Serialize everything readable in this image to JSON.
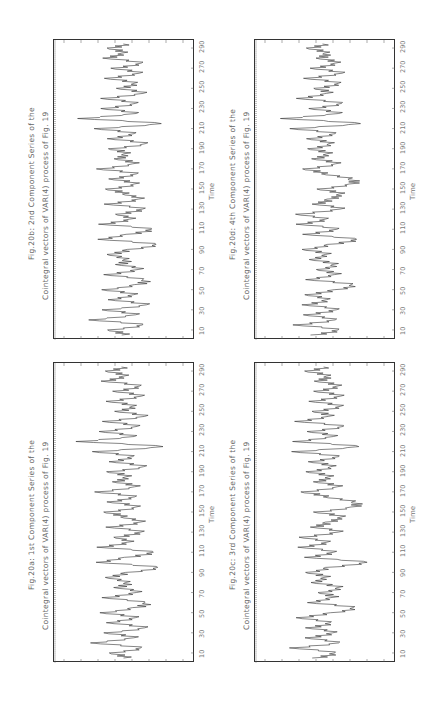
{
  "chart_data": [
    {
      "type": "line",
      "id": "fig20a",
      "title": "Fig.20a: 1st Component Series of the",
      "subtitle": "Cointegral vectors of VAR(4) process of Fig. 19",
      "xlabel": "Time",
      "ylabel": "",
      "xticks": [
        10,
        30,
        50,
        70,
        90,
        110,
        130,
        150,
        170,
        190,
        210,
        230,
        250,
        270,
        290
      ],
      "xlim": [
        1,
        297
      ],
      "ylim": [
        -3,
        3
      ],
      "grid": false,
      "orientation": "rotated-90-ccw",
      "x": [
        5,
        10,
        15,
        20,
        25,
        30,
        35,
        40,
        45,
        50,
        55,
        60,
        65,
        70,
        75,
        80,
        85,
        90,
        95,
        100,
        105,
        110,
        115,
        120,
        125,
        130,
        135,
        140,
        145,
        150,
        155,
        160,
        165,
        170,
        175,
        180,
        185,
        190,
        195,
        200,
        205,
        210,
        215,
        220,
        225,
        230,
        235,
        240,
        245,
        250,
        255,
        260,
        265,
        270,
        275,
        280,
        285,
        290,
        295
      ],
      "values": [
        0.3,
        -0.8,
        1.2,
        -1.5,
        0.9,
        -1.1,
        1.4,
        -0.6,
        1.0,
        -1.3,
        0.7,
        1.6,
        -0.9,
        0.8,
        -0.4,
        0.5,
        -0.7,
        0.2,
        2.1,
        -1.2,
        0.4,
        1.8,
        -1.4,
        0.6,
        -0.2,
        1.1,
        -0.9,
        1.3,
        0.2,
        -1.0,
        0.8,
        -0.6,
        1.0,
        -1.5,
        0.7,
        -0.3,
        0.5,
        -0.8,
        1.2,
        -0.5,
        0.9,
        -1.6,
        2.3,
        -2.4,
        1.0,
        -1.2,
        0.8,
        -0.9,
        1.6,
        -0.3,
        0.5,
        -0.7,
        1.4,
        -0.4,
        0.9,
        -1.0,
        0.4,
        -0.8,
        0.1
      ]
    },
    {
      "type": "line",
      "id": "fig20b",
      "title": "Fig.20b: 2nd Component Series of the",
      "subtitle": "Cointegral vectors of VAR(4) process of Fig. 19",
      "xlabel": "Time",
      "ylabel": "",
      "xticks": [
        10,
        30,
        50,
        70,
        90,
        110,
        130,
        150,
        170,
        190,
        210,
        230,
        250,
        270,
        290
      ],
      "xlim": [
        1,
        297
      ],
      "ylim": [
        -3,
        3
      ],
      "grid": false,
      "orientation": "rotated-90-ccw",
      "x": [
        5,
        10,
        15,
        20,
        25,
        30,
        35,
        40,
        45,
        50,
        55,
        60,
        65,
        70,
        75,
        80,
        85,
        90,
        95,
        100,
        105,
        110,
        115,
        120,
        125,
        130,
        135,
        140,
        145,
        150,
        155,
        160,
        165,
        170,
        175,
        180,
        185,
        190,
        195,
        200,
        205,
        210,
        215,
        220,
        225,
        230,
        235,
        240,
        245,
        250,
        255,
        260,
        265,
        270,
        275,
        280,
        285,
        290,
        295
      ],
      "values": [
        0.2,
        -0.9,
        1.3,
        -1.6,
        1.0,
        -1.2,
        1.5,
        -0.5,
        0.9,
        -1.2,
        0.8,
        1.5,
        -0.8,
        0.9,
        -0.3,
        0.4,
        -0.6,
        0.3,
        2.0,
        -1.1,
        0.5,
        1.7,
        -1.3,
        0.7,
        -0.1,
        1.2,
        -1.0,
        1.2,
        0.3,
        -0.9,
        0.7,
        -0.5,
        1.1,
        -1.4,
        0.6,
        -0.2,
        0.4,
        -0.7,
        1.3,
        -0.6,
        1.0,
        -1.5,
        2.2,
        -2.3,
        1.1,
        -1.1,
        0.7,
        -1.0,
        1.5,
        -0.2,
        0.6,
        -0.8,
        1.3,
        -0.5,
        1.0,
        -0.9,
        0.3,
        -0.7,
        0.2
      ]
    },
    {
      "type": "line",
      "id": "fig20c",
      "title": "Fig.20c: 3rd Component Series of the",
      "subtitle": "Cointegral vectors of VAR(4) process of Fig. 19",
      "xlabel": "Time",
      "ylabel": "",
      "xticks": [
        10,
        30,
        50,
        70,
        90,
        110,
        130,
        150,
        170,
        190,
        210,
        230,
        250,
        270,
        290
      ],
      "xlim": [
        1,
        297
      ],
      "ylim": [
        -3,
        3
      ],
      "grid": false,
      "orientation": "rotated-90-ccw",
      "x": [
        5,
        10,
        15,
        20,
        25,
        30,
        35,
        40,
        45,
        50,
        55,
        60,
        65,
        70,
        75,
        80,
        85,
        90,
        95,
        100,
        105,
        110,
        115,
        120,
        125,
        130,
        135,
        140,
        145,
        150,
        155,
        160,
        165,
        170,
        175,
        180,
        185,
        190,
        195,
        200,
        205,
        210,
        215,
        220,
        225,
        230,
        235,
        240,
        245,
        250,
        255,
        260,
        265,
        270,
        275,
        280,
        285,
        290,
        295
      ],
      "values": [
        -0.4,
        0.6,
        -1.8,
        1.2,
        -0.8,
        0.5,
        -0.9,
        0.7,
        -1.3,
        0.4,
        1.8,
        -0.6,
        0.7,
        -0.3,
        0.9,
        -0.4,
        0.3,
        -1.0,
        0.2,
        2.8,
        -0.8,
        0.6,
        -1.4,
        0.5,
        -1.1,
        0.9,
        -0.7,
        0.4,
        1.3,
        -0.5,
        1.6,
        1.9,
        0.3,
        -1.2,
        0.8,
        -0.3,
        0.6,
        -0.9,
        0.4,
        -0.6,
        1.2,
        -1.7,
        2.0,
        -1.5,
        0.9,
        -0.8,
        1.1,
        -1.4,
        0.6,
        -0.5,
        0.9,
        -0.6,
        1.3,
        -0.4,
        0.7,
        -0.3,
        0.5,
        -0.9,
        0.2
      ]
    },
    {
      "type": "line",
      "id": "fig20d",
      "title": "Fig.20d: 4th Component Series of the",
      "subtitle": "Cointegral vectors of VAR(4) process of Fig. 19",
      "xlabel": "Time",
      "ylabel": "",
      "xticks": [
        10,
        30,
        50,
        70,
        90,
        110,
        130,
        150,
        170,
        190,
        210,
        230,
        250,
        270,
        290
      ],
      "xlim": [
        1,
        297
      ],
      "ylim": [
        -3,
        3
      ],
      "grid": false,
      "orientation": "rotated-90-ccw",
      "x": [
        5,
        10,
        15,
        20,
        25,
        30,
        35,
        40,
        45,
        50,
        55,
        60,
        65,
        70,
        75,
        80,
        85,
        90,
        95,
        100,
        105,
        110,
        115,
        120,
        125,
        130,
        135,
        140,
        145,
        150,
        155,
        160,
        165,
        170,
        175,
        180,
        185,
        190,
        195,
        200,
        205,
        210,
        215,
        220,
        225,
        230,
        235,
        240,
        245,
        250,
        255,
        260,
        265,
        270,
        275,
        280,
        285,
        290,
        295
      ],
      "values": [
        -0.5,
        0.8,
        -1.6,
        1.0,
        -0.9,
        0.7,
        -1.1,
        0.5,
        -0.8,
        0.6,
        1.7,
        -0.7,
        0.9,
        -0.4,
        0.6,
        -0.5,
        0.4,
        -1.2,
        0.3,
        2.2,
        -0.9,
        0.8,
        -1.5,
        0.4,
        -1.3,
        1.0,
        -0.6,
        0.5,
        1.2,
        -0.3,
        1.5,
        1.7,
        0.2,
        -1.1,
        0.7,
        -0.4,
        0.5,
        -0.8,
        0.3,
        -0.7,
        1.0,
        -1.8,
        2.1,
        -2.2,
        1.2,
        -0.7,
        1.0,
        -1.3,
        0.5,
        -0.4,
        0.8,
        -0.9,
        1.4,
        -0.6,
        0.6,
        -0.2,
        0.4,
        -0.8,
        0.1
      ]
    }
  ],
  "panels": {
    "a": {
      "title": "Fig.20a: 1st Component Series of the",
      "subtitle": "Cointegral vectors of VAR(4) process of Fig. 19",
      "xlabel": "Time"
    },
    "b": {
      "title": "Fig.20b: 2nd Component Series of the",
      "subtitle": "Cointegral vectors of VAR(4) process of Fig. 19",
      "xlabel": "Time"
    },
    "c": {
      "title": "Fig.20c: 3rd Component Series of the",
      "subtitle": "Cointegral vectors of VAR(4) process of Fig. 19",
      "xlabel": "Time"
    },
    "d": {
      "title": "Fig.20d: 4th Component Series of the",
      "subtitle": "Cointegral vectors of VAR(4) process of Fig. 19",
      "xlabel": "Time"
    }
  },
  "colors": {
    "line": "#333333",
    "frame": "#333333",
    "text": "#666666"
  }
}
